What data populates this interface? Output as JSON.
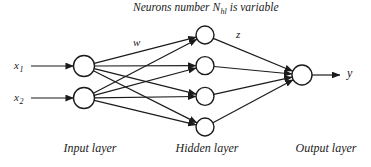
{
  "title": {
    "prefix": "Neurons number N",
    "subscript": "hl",
    "suffix": " is variable"
  },
  "inputs": [
    {
      "label": "x",
      "subscript": "1"
    },
    {
      "label": "x",
      "subscript": "2"
    }
  ],
  "edge_labels": {
    "input_hidden": "w",
    "hidden_output": "z"
  },
  "output": {
    "label": "y"
  },
  "layers": {
    "input": {
      "caption": "Input layer",
      "node_count": 2
    },
    "hidden": {
      "caption": "Hidden layer",
      "node_count": 4
    },
    "output": {
      "caption": "Output layer",
      "node_count": 1
    }
  },
  "colors": {
    "background": "#ffffff",
    "line": "#1b1b1b",
    "node_fill": "#ffffff",
    "text": "#1b1b1b"
  }
}
